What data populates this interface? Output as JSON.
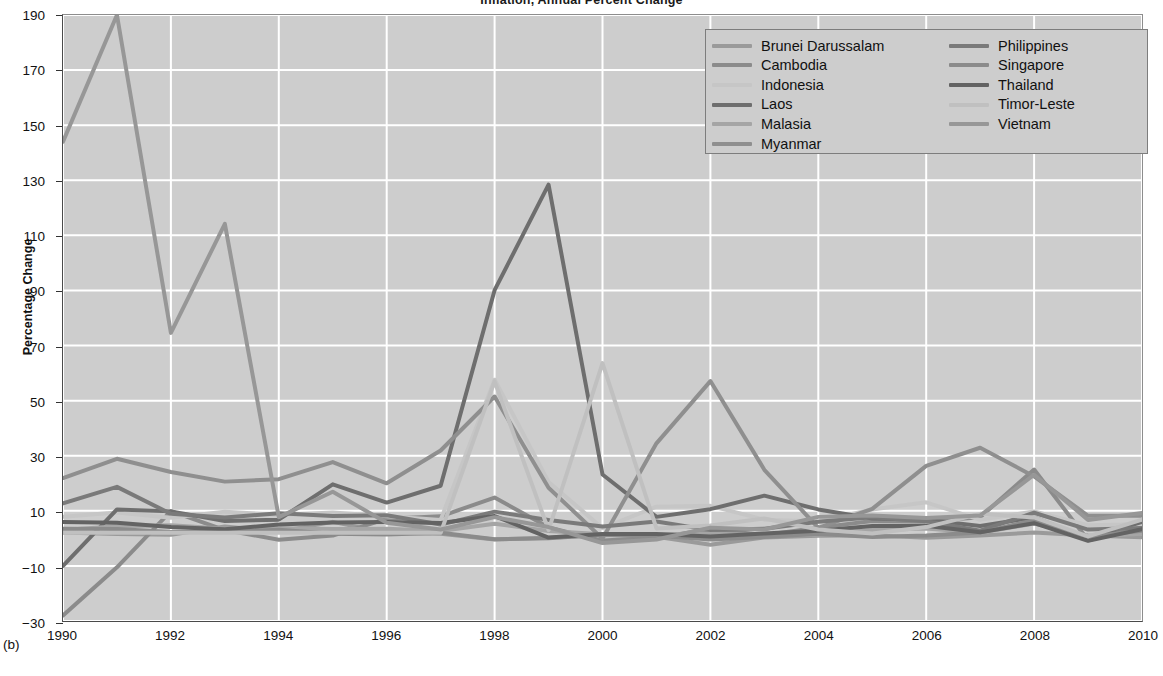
{
  "figure": {
    "panel_label": "(b)",
    "title": "Inflation, Annual Percent Change",
    "ylabel": "Percentage Change"
  },
  "axes": {
    "y_ticks": [
      "-30",
      "-10",
      "10",
      "30",
      "50",
      "70",
      "90",
      "110",
      "130",
      "150",
      "170",
      "190"
    ],
    "x_ticks": [
      "1990",
      "1992",
      "1994",
      "1996",
      "1998",
      "2000",
      "2002",
      "2004",
      "2006",
      "2008",
      "2010"
    ]
  },
  "legend": {
    "left_column": [
      {
        "label": "Brunei Darussalam",
        "color": "#9a9a9a"
      },
      {
        "label": "Cambodia",
        "color": "#8b8b8b"
      },
      {
        "label": "Indonesia",
        "color": "#c6c6c6"
      },
      {
        "label": "Laos",
        "color": "#6e6e6e"
      },
      {
        "label": "Malasia",
        "color": "#a5a5a5"
      },
      {
        "label": "Myanmar",
        "color": "#8f8f8f"
      }
    ],
    "right_column": [
      {
        "label": "Philippines",
        "color": "#7a7a7a"
      },
      {
        "label": "Singapore",
        "color": "#8b8b8b"
      },
      {
        "label": "Thailand",
        "color": "#636363"
      },
      {
        "label": "Timor-Leste",
        "color": "#c0c0c0"
      },
      {
        "label": "Vietnam",
        "color": "#979797"
      }
    ]
  },
  "chart_data": {
    "type": "line",
    "title": "Inflation, Annual Percent Change",
    "xlabel": "",
    "ylabel": "Percentage Change",
    "xlim": [
      1990,
      2010
    ],
    "ylim": [
      -30,
      190
    ],
    "grid": true,
    "legend_position": "top-right",
    "x": [
      1990,
      1991,
      1992,
      1993,
      1994,
      1995,
      1996,
      1997,
      1998,
      1999,
      2000,
      2001,
      2002,
      2003,
      2004,
      2005,
      2006,
      2007,
      2008,
      2009,
      2010
    ],
    "series": [
      {
        "name": "Brunei Darussalam",
        "color": "#9a9a9a",
        "values": [
          2.1,
          1.6,
          1.3,
          4.3,
          2.4,
          6.0,
          2.0,
          1.7,
          -0.4,
          0.2,
          1.2,
          0.6,
          -2.3,
          0.3,
          0.9,
          1.1,
          0.2,
          1.0,
          2.1,
          1.0,
          0.4
        ]
      },
      {
        "name": "Cambodia",
        "color": "#8b8b8b",
        "values": [
          -28.0,
          -10.5,
          9.9,
          3.0,
          -0.5,
          1.0,
          7.1,
          8.0,
          14.8,
          4.0,
          -0.8,
          0.2,
          3.3,
          1.2,
          3.9,
          6.3,
          6.1,
          7.7,
          25.0,
          -0.7,
          4.0
        ]
      },
      {
        "name": "Indonesia",
        "color": "#c6c6c6",
        "values": [
          7.8,
          9.4,
          7.5,
          9.7,
          8.5,
          9.4,
          8.0,
          6.7,
          57.6,
          20.5,
          3.7,
          11.5,
          11.8,
          6.8,
          6.1,
          10.5,
          13.1,
          6.7,
          9.8,
          4.8,
          5.1
        ]
      },
      {
        "name": "Laos",
        "color": "#6e6e6e",
        "values": [
          -10.0,
          10.5,
          9.8,
          6.3,
          6.8,
          19.6,
          13.0,
          19.1,
          90.1,
          128.4,
          23.2,
          7.8,
          10.6,
          15.5,
          10.5,
          7.2,
          6.8,
          4.5,
          7.6,
          0.0,
          6.0
        ]
      },
      {
        "name": "Malasia",
        "color": "#a5a5a5",
        "values": [
          3.0,
          4.4,
          4.8,
          3.5,
          3.7,
          3.4,
          3.5,
          2.7,
          5.3,
          2.7,
          1.5,
          1.4,
          1.8,
          1.1,
          1.4,
          3.0,
          3.6,
          2.0,
          5.4,
          0.6,
          1.7
        ]
      },
      {
        "name": "Myanmar",
        "color": "#8f8f8f",
        "values": [
          21.9,
          28.9,
          24.1,
          20.6,
          21.5,
          27.7,
          20.0,
          31.9,
          51.5,
          18.4,
          -0.1,
          34.5,
          57.1,
          24.9,
          3.8,
          10.7,
          26.3,
          32.9,
          22.5,
          8.2,
          8.2
        ]
      },
      {
        "name": "Philippines",
        "color": "#7a7a7a",
        "values": [
          12.7,
          18.7,
          8.9,
          7.6,
          9.1,
          8.1,
          8.4,
          5.0,
          9.7,
          6.7,
          4.3,
          6.1,
          3.0,
          3.5,
          6.0,
          7.7,
          6.2,
          2.8,
          9.3,
          3.2,
          3.8
        ]
      },
      {
        "name": "Singapore",
        "color": "#8b8b8b",
        "values": [
          3.5,
          3.4,
          2.3,
          2.3,
          3.1,
          1.7,
          1.4,
          2.0,
          -0.3,
          0.0,
          1.3,
          1.0,
          -0.4,
          0.5,
          1.7,
          0.5,
          1.0,
          2.1,
          6.6,
          0.6,
          2.8
        ]
      },
      {
        "name": "Thailand",
        "color": "#636363",
        "values": [
          5.9,
          5.7,
          4.1,
          3.3,
          5.0,
          5.8,
          5.9,
          5.6,
          8.1,
          0.3,
          1.6,
          1.6,
          0.7,
          1.8,
          2.8,
          4.5,
          4.6,
          2.2,
          5.5,
          -0.9,
          3.3
        ]
      },
      {
        "name": "Timor-Leste",
        "color": "#c0c0c0",
        "values": [
          2.0,
          2.0,
          2.0,
          2.0,
          2.0,
          2.0,
          2.0,
          2.0,
          57.0,
          3.0,
          63.6,
          3.6,
          4.7,
          7.2,
          3.2,
          1.8,
          4.1,
          8.9,
          7.6,
          0.7,
          6.8
        ]
      },
      {
        "name": "Vietnam",
        "color": "#979797",
        "values": [
          144.0,
          190.7,
          74.6,
          114.2,
          7.7,
          16.9,
          5.7,
          3.2,
          7.7,
          4.1,
          -1.7,
          -0.4,
          3.9,
          3.2,
          7.8,
          8.3,
          7.4,
          8.3,
          23.1,
          6.7,
          9.2
        ]
      }
    ]
  }
}
